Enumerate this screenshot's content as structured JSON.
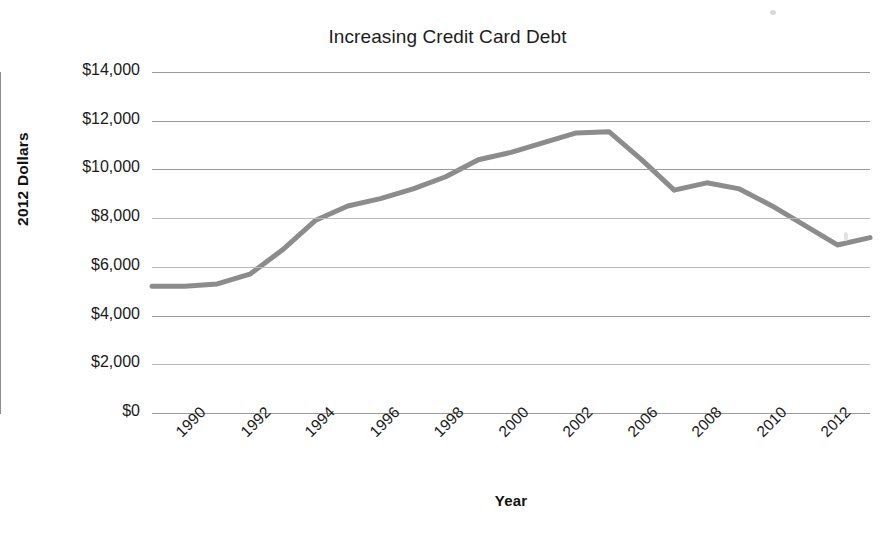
{
  "chart_data": {
    "type": "line",
    "title": "Increasing Credit Card Debt",
    "xlabel": "Year",
    "ylabel": "2012 Dollars",
    "ylim": [
      0,
      14000
    ],
    "xlim": [
      1990,
      2012
    ],
    "grid": true,
    "legend": null,
    "legend_position": "none",
    "line_color": "#8c8c8c",
    "line_width_px": 5,
    "markers": false,
    "ytick_labels": [
      "$14,000",
      "$12,000",
      "$10,000",
      "$8,000",
      "$6,000",
      "$4,000",
      "$2,000",
      "$0"
    ],
    "ytick_values": [
      14000,
      12000,
      10000,
      8000,
      6000,
      4000,
      2000,
      0
    ],
    "xtick_labels": [
      "1990",
      "1992",
      "1994",
      "1996",
      "1998",
      "2000",
      "2002",
      "2006",
      "2008",
      "2010",
      "2012"
    ],
    "x": [
      1990,
      1991,
      1992,
      1993,
      1994,
      1995,
      1996,
      1997,
      1998,
      1999,
      2000,
      2001,
      2002,
      2003,
      2004,
      2005,
      2006,
      2007,
      2008,
      2009,
      2010,
      2011,
      2012
    ],
    "series": [
      {
        "name": "Credit Card Debt",
        "values": [
          5200,
          5200,
          5300,
          5700,
          6700,
          7900,
          8500,
          8800,
          9200,
          9700,
          10400,
          10700,
          11100,
          11500,
          11550,
          10400,
          9150,
          9450,
          9200,
          8500,
          7700,
          6900,
          7200
        ]
      }
    ]
  },
  "axes": {
    "y_title": "2012 Dollars",
    "x_title": "Year"
  }
}
